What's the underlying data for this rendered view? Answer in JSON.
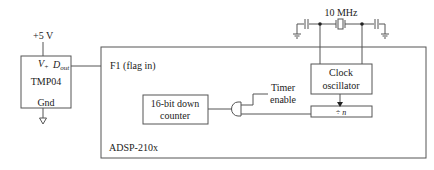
{
  "diagram": {
    "type": "block-schematic",
    "colors": {
      "line": "#555555",
      "text": "#222222",
      "background": "#ffffff"
    },
    "supply": {
      "label": "+5 V"
    },
    "sensor": {
      "name": "TMP04",
      "pins": {
        "vplus": "V",
        "vplus_sub": "+",
        "dout": "D",
        "dout_sub": "out",
        "gnd": "Gnd"
      }
    },
    "dsp": {
      "name": "ADSP-210x",
      "flag_input_label": "F1 (flag in)",
      "counter": {
        "line1": "16-bit down",
        "line2": "counter"
      },
      "timer_enable": {
        "line1": "Timer",
        "line2": "enable"
      },
      "clock": {
        "line1": "Clock",
        "line2": "oscillator"
      },
      "divider": {
        "label": "÷ n"
      }
    },
    "crystal": {
      "frequency_label": "10 MHz"
    }
  }
}
